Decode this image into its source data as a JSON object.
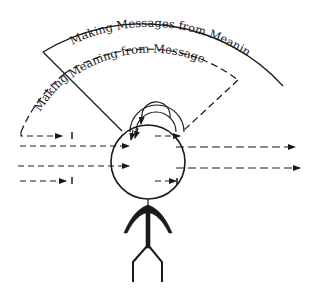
{
  "diagram": {
    "outer_label": "Making Messages from Meaning",
    "inner_label_top": "Meaning from Messages",
    "inner_label_side": "Making",
    "elements": {
      "head_circle": "person's head / mind",
      "self_loops": 3,
      "incoming_arrows": 4,
      "outgoing_arrows": 2,
      "figure": "stick figure"
    },
    "colors": {
      "ink": "#1a1a1a",
      "background": "#ffffff"
    }
  }
}
